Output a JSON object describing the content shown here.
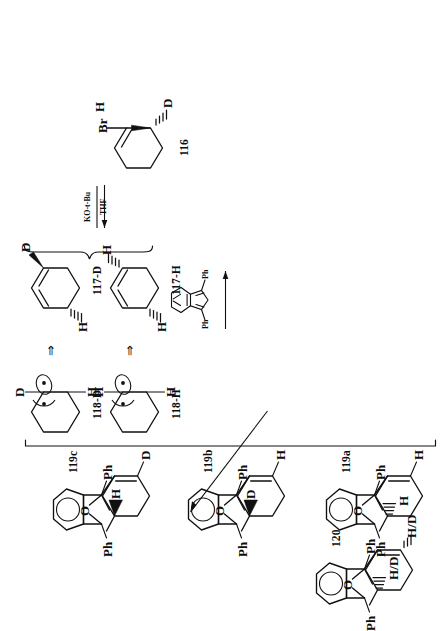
{
  "scheme": {
    "orientation": "rotated-90-ccw",
    "title": "",
    "ink_color": "#111111",
    "background": "#ffffff"
  },
  "reagents": {
    "base_line1": "KO-t-Bu",
    "base_line2": "THF",
    "trapping_agent_label_left": "Ph",
    "trapping_agent_label_right": "Ph",
    "trapping_agent_name": "1,3-diphenylisobenzofuran"
  },
  "symbols": {
    "equivalence": "⇒",
    "bridge_oxygen": "O",
    "radical": "*"
  },
  "structures": [
    {
      "id": "116",
      "name": "116",
      "kind": "bromo-deuterio-cyclohexene",
      "atoms": [
        "Br",
        "H",
        "D"
      ],
      "stereo": [
        "hashed-H",
        "wedge-D"
      ]
    },
    {
      "id": "117-H",
      "name": "117-H",
      "kind": "cyclohexa-1,2-diene",
      "atoms": [
        "H",
        "H"
      ],
      "stereo": [
        "hashed-H",
        "hashed-H"
      ]
    },
    {
      "id": "117-D",
      "name": "117-D",
      "kind": "cyclohexa-1,2-diene",
      "atoms": [
        "D",
        "H"
      ],
      "stereo": [
        "wedge-D",
        "hashed-H"
      ]
    },
    {
      "id": "118-H",
      "name": "118-H",
      "kind": "diradical-intermediate",
      "atoms": [
        "H",
        "H"
      ],
      "stereo": [
        "lobe",
        "arc"
      ]
    },
    {
      "id": "118-D",
      "name": "118-D",
      "kind": "diradical-intermediate",
      "atoms": [
        "D",
        "H"
      ],
      "stereo": [
        "lobe",
        "arc"
      ]
    },
    {
      "id": "119a",
      "name": "119a",
      "kind": "oxabenzonorbornene-adduct",
      "atoms": [
        "H",
        "Ph",
        "Ph",
        "H"
      ],
      "stereo": [
        "hashed-H"
      ]
    },
    {
      "id": "119b",
      "name": "119b",
      "kind": "oxabenzonorbornene-adduct",
      "atoms": [
        "H",
        "Ph",
        "Ph",
        "D"
      ],
      "stereo": [
        "wedge-D"
      ]
    },
    {
      "id": "119c",
      "name": "119c",
      "kind": "oxabenzonorbornene-adduct",
      "atoms": [
        "D",
        "Ph",
        "Ph",
        "H"
      ],
      "stereo": [
        "wedge-H"
      ]
    },
    {
      "id": "120",
      "name": "120",
      "kind": "oxabenzonorbornene-adduct",
      "atoms": [
        "H/D",
        "Ph",
        "Ph",
        "H/D"
      ],
      "stereo": [
        "hashed-HD"
      ]
    }
  ],
  "labels": {
    "id_116": "116",
    "id_117H": "117-H",
    "id_117D": "117-D",
    "id_118H": "118-H",
    "id_118D": "118-D",
    "id_119a": "119a",
    "id_119b": "119b",
    "id_119c": "119c",
    "id_120": "120",
    "br": "Br",
    "h": "H",
    "d": "D",
    "hd": "H/D",
    "ph": "Ph",
    "o": "O",
    "eq": "⇒"
  }
}
